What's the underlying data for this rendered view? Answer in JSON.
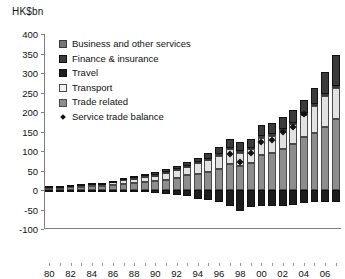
{
  "chart_data": {
    "type": "bar",
    "title": "",
    "ylabel": "HK$bn",
    "xlabel": "",
    "ylim": [
      -100,
      400
    ],
    "yticks": [
      400,
      350,
      300,
      250,
      200,
      150,
      100,
      50,
      0,
      -50,
      -100
    ],
    "ytick_labels": [
      "400",
      "350",
      "300",
      "250",
      "200",
      "150",
      "100",
      "50",
      "0",
      "-50",
      "-100"
    ],
    "grid": false,
    "legend_position": "upper-left",
    "stacked": true,
    "x": [
      1980,
      1981,
      1982,
      1983,
      1984,
      1985,
      1986,
      1987,
      1988,
      1989,
      1990,
      1991,
      1992,
      1993,
      1994,
      1995,
      1996,
      1997,
      1998,
      1999,
      2000,
      2001,
      2002,
      2003,
      2004,
      2005,
      2006,
      2007
    ],
    "categories": [
      "80",
      "81",
      "82",
      "83",
      "84",
      "85",
      "86",
      "87",
      "88",
      "89",
      "90",
      "91",
      "92",
      "93",
      "94",
      "95",
      "96",
      "97",
      "98",
      "99",
      "00",
      "01",
      "02",
      "03",
      "04",
      "05",
      "06",
      "07"
    ],
    "xtick_labels": [
      "80",
      "82",
      "84",
      "86",
      "88",
      "90",
      "92",
      "94",
      "96",
      "98",
      "00",
      "02",
      "04",
      "06"
    ],
    "xtick_positions": [
      1980,
      1982,
      1984,
      1986,
      1988,
      1990,
      1992,
      1994,
      1996,
      1998,
      2000,
      2002,
      2004,
      2006
    ],
    "series": [
      {
        "name": "Trade related",
        "color": "#8d8d8d",
        "values": [
          5,
          6,
          7,
          8,
          9,
          10,
          12,
          15,
          18,
          20,
          22,
          26,
          32,
          38,
          42,
          46,
          54,
          66,
          62,
          68,
          90,
          95,
          104,
          118,
          135,
          146,
          162,
          182
        ]
      },
      {
        "name": "Transport",
        "color": "#e2e2e2",
        "values": [
          4,
          4,
          5,
          5,
          6,
          7,
          8,
          11,
          13,
          14,
          16,
          18,
          20,
          22,
          26,
          30,
          34,
          38,
          34,
          36,
          44,
          44,
          48,
          50,
          58,
          70,
          80,
          80
        ]
      },
      {
        "name": "Travel",
        "color": "#1d1d1d",
        "values": [
          -2,
          -2,
          -2,
          -3,
          -3,
          -3,
          -4,
          -4,
          -5,
          -6,
          -7,
          -9,
          -12,
          -16,
          -22,
          -26,
          -30,
          -42,
          -54,
          -44,
          -40,
          -40,
          -42,
          -38,
          -34,
          -32,
          -32,
          -30
        ]
      },
      {
        "name": "Finance & insurance",
        "color": "#3b3b3b",
        "values": [
          1,
          1,
          1,
          2,
          2,
          2,
          3,
          4,
          5,
          5,
          6,
          7,
          8,
          10,
          12,
          14,
          18,
          22,
          22,
          24,
          28,
          28,
          30,
          32,
          34,
          42,
          56,
          80
        ]
      },
      {
        "name": "Business and other services",
        "color": "#767676",
        "values": [
          0,
          0,
          0,
          0,
          0,
          0,
          0,
          1,
          1,
          1,
          1,
          2,
          2,
          2,
          3,
          4,
          4,
          4,
          4,
          4,
          4,
          4,
          4,
          4,
          4,
          4,
          4,
          4
        ]
      }
    ],
    "marker_series": {
      "name": "Service trade balance",
      "color": "#111111",
      "marker": "diamond",
      "values": [
        null,
        null,
        null,
        null,
        null,
        null,
        null,
        null,
        null,
        null,
        null,
        null,
        null,
        null,
        null,
        null,
        null,
        92,
        72,
        96,
        122,
        128,
        150,
        162,
        194,
        null,
        null,
        null
      ]
    },
    "legend": [
      {
        "label": "Business and other services",
        "swatch": "business"
      },
      {
        "label": "Finance & insurance",
        "swatch": "finance"
      },
      {
        "label": "Travel",
        "swatch": "travel"
      },
      {
        "label": "Transport",
        "swatch": "transport"
      },
      {
        "label": "Trade related",
        "swatch": "trade"
      },
      {
        "label": "Service trade balance",
        "swatch": "marker"
      }
    ]
  }
}
